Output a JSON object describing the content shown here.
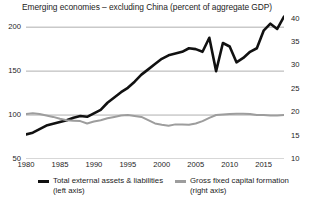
{
  "chart_data": {
    "type": "line",
    "title": "Emerging economies – excluding China (percent of aggregate GDP)",
    "xlabel": "",
    "ylabel": "",
    "grid": true,
    "legend_position": "bottom",
    "x": [
      1980,
      1981,
      1982,
      1983,
      1984,
      1985,
      1986,
      1987,
      1988,
      1989,
      1990,
      1991,
      1992,
      1993,
      1994,
      1995,
      1996,
      1997,
      1998,
      1999,
      2000,
      2001,
      2002,
      2003,
      2004,
      2005,
      2006,
      2007,
      2008,
      2009,
      2010,
      2011,
      2012,
      2013,
      2014,
      2015,
      2016,
      2017,
      2018
    ],
    "xticks": [
      1980,
      1985,
      1990,
      1995,
      2000,
      2005,
      2010,
      2015
    ],
    "xlim": [
      1980,
      2018
    ],
    "left_axis": {
      "ticks": [
        50,
        100,
        150,
        200
      ],
      "lim": [
        50,
        215
      ],
      "label": ""
    },
    "right_axis": {
      "ticks": [
        10,
        15,
        20,
        25,
        30,
        35,
        40
      ],
      "lim": [
        10,
        41
      ],
      "label": ""
    },
    "series": [
      {
        "name": "Total external assets & liabilities",
        "axis": "left",
        "color": "#111111",
        "sublabel": "(left axis)",
        "values": [
          78,
          80,
          84,
          88,
          90,
          92,
          94,
          97,
          99,
          98,
          102,
          106,
          114,
          120,
          126,
          131,
          138,
          146,
          152,
          158,
          164,
          168,
          170,
          172,
          176,
          175,
          172,
          188,
          150,
          182,
          178,
          160,
          165,
          172,
          176,
          196,
          204,
          198,
          212
        ]
      },
      {
        "name": "Gross fixed capital formation",
        "axis": "right",
        "color": "#9d9d9d",
        "sublabel": "(right axis)",
        "values": [
          19.6,
          19.8,
          19.6,
          19.3,
          19.0,
          18.6,
          18.3,
          18.2,
          18.1,
          17.6,
          18.0,
          18.3,
          18.7,
          19.0,
          19.3,
          19.4,
          19.2,
          19.0,
          18.3,
          17.6,
          17.3,
          17.1,
          17.4,
          17.4,
          17.3,
          17.6,
          18.1,
          18.8,
          19.4,
          19.5,
          19.6,
          19.7,
          19.7,
          19.6,
          19.4,
          19.4,
          19.3,
          19.3,
          19.4
        ]
      }
    ]
  },
  "axes_text": {
    "left_ticks": [
      "200",
      "150",
      "100",
      "50"
    ],
    "right_ticks": [
      "40",
      "35",
      "30",
      "25",
      "20",
      "15",
      "10"
    ],
    "x_ticks": [
      "1980",
      "1985",
      "1990",
      "1995",
      "2000",
      "2005",
      "2010",
      "2015"
    ]
  },
  "legend": {
    "items": [
      {
        "label": "Total external assets & liabilities",
        "sublabel": "(left axis)",
        "color": "#111111"
      },
      {
        "label": "Gross fixed capital formation",
        "sublabel": "(right axis)",
        "color": "#9d9d9d"
      }
    ]
  },
  "colors": {
    "series_black": "#111111",
    "series_gray": "#9d9d9d",
    "gridline": "#a6a6a6",
    "text": "#1c1c1c",
    "background": "#ffffff"
  }
}
